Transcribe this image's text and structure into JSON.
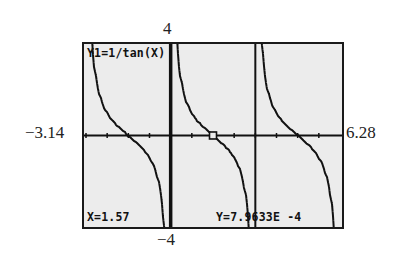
{
  "window": {
    "xmin_label": "−3.14",
    "xmax_label": "6.28",
    "ymax_label": "4",
    "ymin_label": "−4"
  },
  "screen": {
    "function_label": "Y1=1/tan(X)",
    "trace_x": "X=1.57",
    "trace_y": "Y=7.9633E -4",
    "colors": {
      "background": "#ececec",
      "ink": "#111111",
      "frame": "#1a1a1a"
    }
  },
  "chart_data": {
    "type": "line",
    "title": "Y1=1/tan(X)",
    "function": "1/tan(x)",
    "xlabel": "",
    "ylabel": "",
    "xlim": [
      -3.14,
      6.28
    ],
    "ylim": [
      -4,
      4
    ],
    "xscale_tick": 0.785,
    "grid": false,
    "axes_visible": true,
    "vertical_asymptote_lines": [
      0,
      3.14
    ],
    "branches": [
      {
        "x_start": -3.14,
        "x_end": 0
      },
      {
        "x_start": 0,
        "x_end": 3.14
      },
      {
        "x_start": 3.14,
        "x_end": 6.28
      }
    ],
    "zeros": [
      -1.57,
      1.57,
      4.71
    ],
    "sample_points": [
      {
        "x": -2.9,
        "y": 4.0
      },
      {
        "x": -2.36,
        "y": 1.0
      },
      {
        "x": -1.57,
        "y": 0.0
      },
      {
        "x": -0.79,
        "y": -1.0
      },
      {
        "x": -0.24,
        "y": -4.0
      },
      {
        "x": 0.24,
        "y": 4.0
      },
      {
        "x": 0.79,
        "y": 1.0
      },
      {
        "x": 1.57,
        "y": 0.0
      },
      {
        "x": 2.36,
        "y": -1.0
      },
      {
        "x": 2.9,
        "y": -4.0
      },
      {
        "x": 3.39,
        "y": 4.0
      },
      {
        "x": 3.93,
        "y": 1.0
      },
      {
        "x": 4.71,
        "y": 0.0
      },
      {
        "x": 5.5,
        "y": -1.0
      },
      {
        "x": 6.04,
        "y": -4.0
      }
    ],
    "trace_cursor": {
      "x": 1.57,
      "y": 0.00079633
    },
    "annotations": [
      "X=1.57",
      "Y=7.9633E -4"
    ]
  }
}
